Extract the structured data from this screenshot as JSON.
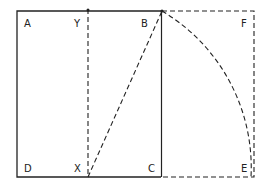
{
  "diagram": {
    "points": {
      "A": "A",
      "Y": "Y",
      "B": "B",
      "F": "F",
      "D": "D",
      "X": "X",
      "C": "C",
      "E": "E"
    },
    "colors": {
      "ink": "#222222",
      "background": "#ffffff"
    }
  }
}
